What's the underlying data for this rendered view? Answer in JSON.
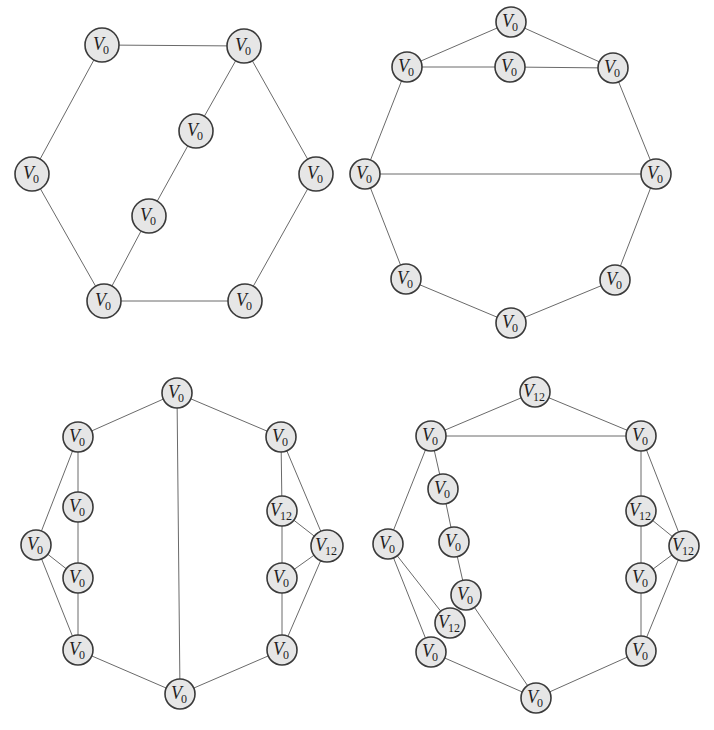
{
  "figure": {
    "node_fill": "#e6e6e6",
    "node_stroke": "#3a3a3a",
    "edge_color": "#6a6a6a"
  },
  "graphs": [
    {
      "id": "top-left",
      "nodes": [
        {
          "id": "a",
          "x": 102,
          "y": 45,
          "base": "V",
          "sub": "0",
          "r": 17
        },
        {
          "id": "b",
          "x": 244,
          "y": 46,
          "base": "V",
          "sub": "0",
          "r": 17
        },
        {
          "id": "c",
          "x": 196,
          "y": 131,
          "base": "V",
          "sub": "0",
          "r": 17
        },
        {
          "id": "d",
          "x": 32,
          "y": 174,
          "base": "V",
          "sub": "0",
          "r": 17
        },
        {
          "id": "e",
          "x": 316,
          "y": 174,
          "base": "V",
          "sub": "0",
          "r": 17
        },
        {
          "id": "f",
          "x": 149,
          "y": 216,
          "base": "V",
          "sub": "0",
          "r": 17
        },
        {
          "id": "g",
          "x": 104,
          "y": 301,
          "base": "V",
          "sub": "0",
          "r": 17
        },
        {
          "id": "h",
          "x": 245,
          "y": 301,
          "base": "V",
          "sub": "0",
          "r": 17
        }
      ],
      "edges": [
        [
          "a",
          "b"
        ],
        [
          "a",
          "d"
        ],
        [
          "d",
          "g"
        ],
        [
          "g",
          "h"
        ],
        [
          "h",
          "e"
        ],
        [
          "e",
          "b"
        ],
        [
          "b",
          "c"
        ],
        [
          "c",
          "f"
        ],
        [
          "f",
          "g"
        ]
      ]
    },
    {
      "id": "top-right",
      "nodes": [
        {
          "id": "a",
          "x": 511,
          "y": 22,
          "base": "V",
          "sub": "0",
          "r": 15
        },
        {
          "id": "b",
          "x": 407,
          "y": 67,
          "base": "V",
          "sub": "0",
          "r": 15
        },
        {
          "id": "c",
          "x": 510,
          "y": 67,
          "base": "V",
          "sub": "0",
          "r": 15
        },
        {
          "id": "d",
          "x": 613,
          "y": 68,
          "base": "V",
          "sub": "0",
          "r": 15
        },
        {
          "id": "e",
          "x": 365,
          "y": 174,
          "base": "V",
          "sub": "0",
          "r": 15
        },
        {
          "id": "f",
          "x": 656,
          "y": 174,
          "base": "V",
          "sub": "0",
          "r": 15
        },
        {
          "id": "g",
          "x": 406,
          "y": 279,
          "base": "V",
          "sub": "0",
          "r": 15
        },
        {
          "id": "h",
          "x": 615,
          "y": 280,
          "base": "V",
          "sub": "0",
          "r": 15
        },
        {
          "id": "i",
          "x": 511,
          "y": 323,
          "base": "V",
          "sub": "0",
          "r": 15
        }
      ],
      "edges": [
        [
          "a",
          "b"
        ],
        [
          "a",
          "d"
        ],
        [
          "b",
          "c"
        ],
        [
          "c",
          "d"
        ],
        [
          "b",
          "e"
        ],
        [
          "d",
          "f"
        ],
        [
          "e",
          "f"
        ],
        [
          "e",
          "g"
        ],
        [
          "f",
          "h"
        ],
        [
          "g",
          "i"
        ],
        [
          "h",
          "i"
        ]
      ]
    },
    {
      "id": "bottom-left",
      "nodes": [
        {
          "id": "a",
          "x": 177,
          "y": 393,
          "base": "V",
          "sub": "0",
          "r": 15
        },
        {
          "id": "b",
          "x": 78,
          "y": 437,
          "base": "V",
          "sub": "0",
          "r": 15
        },
        {
          "id": "c",
          "x": 281,
          "y": 437,
          "base": "V",
          "sub": "0",
          "r": 15
        },
        {
          "id": "d",
          "x": 78,
          "y": 507,
          "base": "V",
          "sub": "0",
          "r": 15
        },
        {
          "id": "e",
          "x": 282,
          "y": 511,
          "base": "V",
          "sub": "12",
          "r": 15
        },
        {
          "id": "f",
          "x": 36,
          "y": 545,
          "base": "V",
          "sub": "0",
          "r": 15
        },
        {
          "id": "g",
          "x": 327,
          "y": 546,
          "base": "V",
          "sub": "12",
          "r": 16
        },
        {
          "id": "h",
          "x": 78,
          "y": 578,
          "base": "V",
          "sub": "0",
          "r": 15
        },
        {
          "id": "i",
          "x": 282,
          "y": 578,
          "base": "V",
          "sub": "0",
          "r": 15
        },
        {
          "id": "j",
          "x": 78,
          "y": 650,
          "base": "V",
          "sub": "0",
          "r": 15
        },
        {
          "id": "k",
          "x": 282,
          "y": 650,
          "base": "V",
          "sub": "0",
          "r": 15
        },
        {
          "id": "l",
          "x": 180,
          "y": 694,
          "base": "V",
          "sub": "0",
          "r": 15
        }
      ],
      "edges": [
        [
          "a",
          "b"
        ],
        [
          "a",
          "c"
        ],
        [
          "a",
          "l"
        ],
        [
          "b",
          "d"
        ],
        [
          "b",
          "f"
        ],
        [
          "d",
          "h"
        ],
        [
          "f",
          "h"
        ],
        [
          "f",
          "j"
        ],
        [
          "h",
          "j"
        ],
        [
          "j",
          "l"
        ],
        [
          "c",
          "e"
        ],
        [
          "c",
          "g"
        ],
        [
          "e",
          "g"
        ],
        [
          "e",
          "i"
        ],
        [
          "g",
          "i"
        ],
        [
          "g",
          "k"
        ],
        [
          "i",
          "k"
        ],
        [
          "k",
          "l"
        ]
      ]
    },
    {
      "id": "bottom-right",
      "nodes": [
        {
          "id": "a",
          "x": 535,
          "y": 392,
          "base": "V",
          "sub": "12",
          "r": 15
        },
        {
          "id": "b",
          "x": 431,
          "y": 436,
          "base": "V",
          "sub": "0",
          "r": 15
        },
        {
          "id": "c",
          "x": 641,
          "y": 436,
          "base": "V",
          "sub": "0",
          "r": 15
        },
        {
          "id": "d",
          "x": 443,
          "y": 489,
          "base": "V",
          "sub": "0",
          "r": 15
        },
        {
          "id": "e",
          "x": 641,
          "y": 511,
          "base": "V",
          "sub": "12",
          "r": 15
        },
        {
          "id": "f",
          "x": 454,
          "y": 542,
          "base": "V",
          "sub": "0",
          "r": 15
        },
        {
          "id": "g",
          "x": 388,
          "y": 544,
          "base": "V",
          "sub": "0",
          "r": 15
        },
        {
          "id": "h",
          "x": 684,
          "y": 546,
          "base": "V",
          "sub": "12",
          "r": 15
        },
        {
          "id": "i",
          "x": 466,
          "y": 595,
          "base": "V",
          "sub": "0",
          "r": 15
        },
        {
          "id": "j",
          "x": 641,
          "y": 578,
          "base": "V",
          "sub": "0",
          "r": 15
        },
        {
          "id": "k",
          "x": 450,
          "y": 623,
          "base": "V",
          "sub": "12",
          "r": 15
        },
        {
          "id": "l",
          "x": 431,
          "y": 652,
          "base": "V",
          "sub": "0",
          "r": 15
        },
        {
          "id": "m",
          "x": 641,
          "y": 651,
          "base": "V",
          "sub": "0",
          "r": 15
        },
        {
          "id": "n",
          "x": 536,
          "y": 698,
          "base": "V",
          "sub": "0",
          "r": 15
        }
      ],
      "edges": [
        [
          "a",
          "b"
        ],
        [
          "a",
          "c"
        ],
        [
          "b",
          "c"
        ],
        [
          "b",
          "d"
        ],
        [
          "d",
          "f"
        ],
        [
          "f",
          "i"
        ],
        [
          "i",
          "n"
        ],
        [
          "b",
          "g"
        ],
        [
          "g",
          "k"
        ],
        [
          "g",
          "l"
        ],
        [
          "l",
          "n"
        ],
        [
          "c",
          "e"
        ],
        [
          "c",
          "h"
        ],
        [
          "e",
          "h"
        ],
        [
          "e",
          "j"
        ],
        [
          "h",
          "j"
        ],
        [
          "h",
          "m"
        ],
        [
          "j",
          "m"
        ],
        [
          "m",
          "n"
        ]
      ]
    }
  ]
}
